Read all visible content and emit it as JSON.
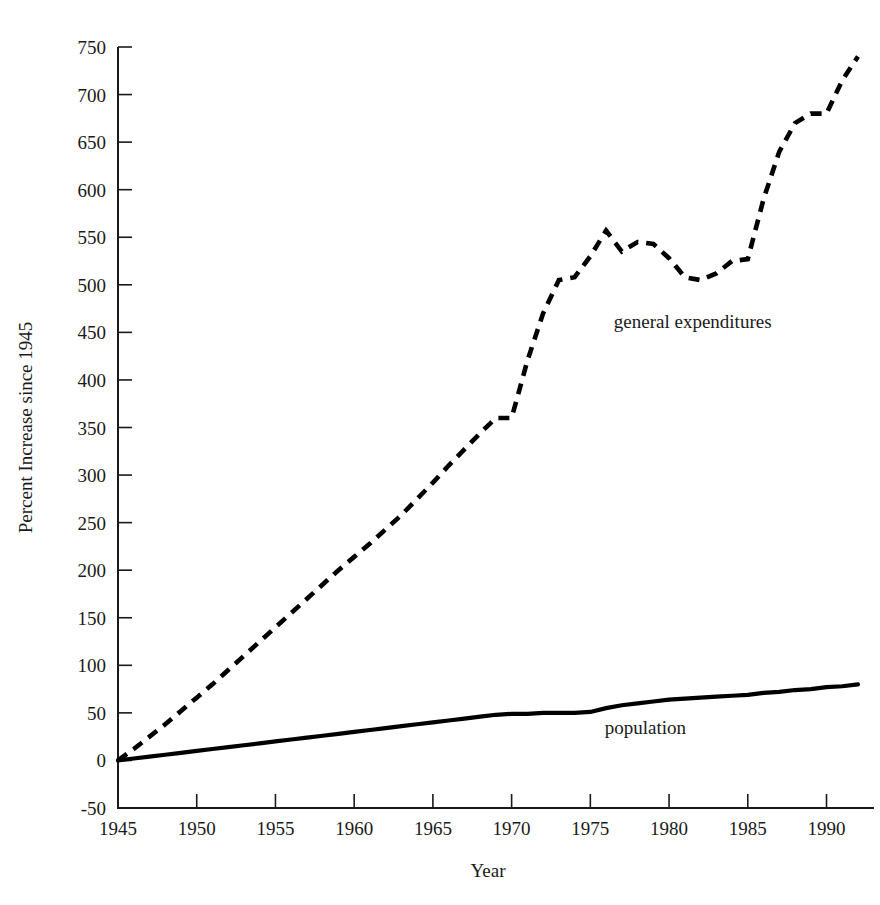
{
  "chart_data": {
    "type": "line",
    "title": "",
    "xlabel": "Year",
    "ylabel": "Percent Increase since 1945",
    "xlim": [
      1945,
      1992
    ],
    "ylim": [
      -50,
      750
    ],
    "grid": false,
    "legend_position": "inline-annotation",
    "y_ticks": [
      -50,
      0,
      50,
      100,
      150,
      200,
      250,
      300,
      350,
      400,
      450,
      500,
      550,
      600,
      650,
      700,
      750
    ],
    "y_tick_labels": [
      "-50",
      "0",
      "50",
      "100",
      "150",
      "200",
      "250",
      "300",
      "350",
      "400",
      "450",
      "500",
      "550",
      "600",
      "650",
      "700",
      "750"
    ],
    "x_ticks": [
      1945,
      1950,
      1955,
      1960,
      1965,
      1970,
      1975,
      1980,
      1985,
      1990
    ],
    "x_tick_labels": [
      "1945",
      "1950",
      "1955",
      "1960",
      "1965",
      "1970",
      "1975",
      "1980",
      "1985",
      "1990"
    ],
    "series": [
      {
        "name": "general expenditures",
        "label": "general expenditures",
        "style": "dashed",
        "color": "#000000",
        "label_x": 1981.5,
        "label_y": 455,
        "x": [
          1945,
          1946,
          1947,
          1948,
          1949,
          1950,
          1951,
          1952,
          1953,
          1954,
          1955,
          1956,
          1957,
          1958,
          1959,
          1960,
          1961,
          1962,
          1963,
          1964,
          1965,
          1966,
          1967,
          1968,
          1969,
          1970,
          1971,
          1972,
          1973,
          1974,
          1975,
          1976,
          1977,
          1978,
          1979,
          1980,
          1981,
          1982,
          1983,
          1984,
          1985,
          1986,
          1987,
          1988,
          1989,
          1990,
          1991,
          1992
        ],
        "y": [
          0,
          12,
          25,
          38,
          52,
          66,
          80,
          95,
          110,
          125,
          140,
          155,
          170,
          185,
          200,
          214,
          228,
          243,
          258,
          275,
          292,
          310,
          327,
          344,
          360,
          360,
          420,
          470,
          505,
          508,
          530,
          557,
          535,
          545,
          543,
          528,
          508,
          505,
          512,
          525,
          527,
          590,
          640,
          670,
          680,
          680,
          715,
          740
        ]
      },
      {
        "name": "population",
        "label": "population",
        "style": "solid",
        "color": "#000000",
        "label_x": 1978.5,
        "label_y": 28,
        "x": [
          1945,
          1946,
          1947,
          1948,
          1949,
          1950,
          1951,
          1952,
          1953,
          1954,
          1955,
          1956,
          1957,
          1958,
          1959,
          1960,
          1961,
          1962,
          1963,
          1964,
          1965,
          1966,
          1967,
          1968,
          1969,
          1970,
          1971,
          1972,
          1973,
          1974,
          1975,
          1976,
          1977,
          1978,
          1979,
          1980,
          1981,
          1982,
          1983,
          1984,
          1985,
          1986,
          1987,
          1988,
          1989,
          1990,
          1991,
          1992
        ],
        "y": [
          0,
          2,
          4,
          6,
          8,
          10,
          12,
          14,
          16,
          18,
          20,
          22,
          24,
          26,
          28,
          30,
          32,
          34,
          36,
          38,
          40,
          42,
          44,
          46,
          48,
          49,
          49,
          50,
          50,
          50,
          51,
          55,
          58,
          60,
          62,
          64,
          65,
          66,
          67,
          68,
          69,
          71,
          72,
          74,
          75,
          77,
          78,
          80
        ]
      }
    ]
  }
}
